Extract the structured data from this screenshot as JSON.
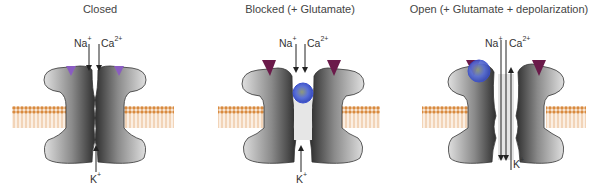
{
  "figure": {
    "panels": [
      {
        "id": "closed",
        "title": "Closed",
        "ions_in": {
          "na": "Na",
          "na_charge": "+",
          "ca": "Ca",
          "ca_charge": "2+"
        },
        "ion_out": {
          "k": "K",
          "k_charge": "+"
        },
        "glutamate_bound": false,
        "mg_block": false,
        "pore_open": false
      },
      {
        "id": "blocked",
        "title": "Blocked (+ Glutamate)",
        "ions_in": {
          "na": "Na",
          "na_charge": "+",
          "ca": "Ca",
          "ca_charge": "2+"
        },
        "ion_out": {
          "k": "K",
          "k_charge": "+"
        },
        "glutamate_bound": true,
        "mg_block": true,
        "pore_open": false
      },
      {
        "id": "open",
        "title": "Open (+ Glutamate + depolarization)",
        "ions_in": {
          "na": "Na",
          "na_charge": "+",
          "ca": "Ca",
          "ca_charge": "2+"
        },
        "ion_out": {
          "k": "K",
          "k_charge": "+"
        },
        "glutamate_bound": true,
        "mg_block": false,
        "pore_open": true
      }
    ],
    "colors": {
      "channel_dark": "#3a3a3a",
      "channel_light": "#d8d8d8",
      "membrane_head": "#d98a3f",
      "membrane_tail": "#f2d2b0",
      "glutamate_site_closed": "#8a5cc2",
      "glutamate_site_bound": "#6b1a4a",
      "mg_ion": "#4b63d6",
      "text": "#333333"
    }
  }
}
